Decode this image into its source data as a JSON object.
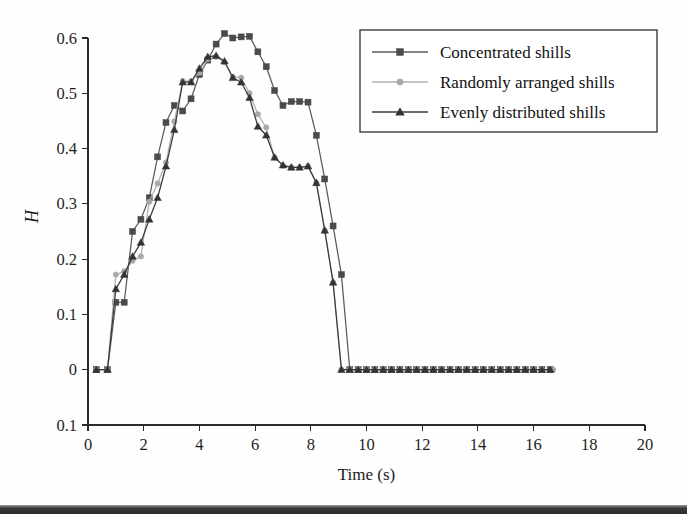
{
  "chart_data": {
    "type": "line",
    "title": "",
    "xlabel": "Time (s)",
    "ylabel": "H",
    "xlim": [
      0,
      20
    ],
    "ylim": [
      -0.1,
      0.6
    ],
    "xticks": [
      0,
      2,
      4,
      6,
      8,
      10,
      12,
      14,
      16,
      18,
      20
    ],
    "xtick_labels": [
      "0",
      "2",
      "4",
      "6",
      "8",
      "10",
      "12",
      "14",
      "16",
      "18",
      "20"
    ],
    "yticks": [
      0.6,
      0.5,
      0.4,
      0.3,
      0.2,
      0.1,
      0,
      -0.1
    ],
    "ytick_labels": [
      "0.6",
      "0.5",
      "0.4",
      "0.3",
      "0.2",
      "0.1",
      "0",
      "0.1"
    ],
    "grid": false,
    "legend_position": "top-right",
    "series": [
      {
        "name": "Concentrated shills",
        "marker": "square",
        "color": "#4a4a4a",
        "line_color": "#5a5a5a",
        "x": [
          0.3,
          0.7,
          1.0,
          1.3,
          1.6,
          1.9,
          2.2,
          2.5,
          2.8,
          3.1,
          3.4,
          3.7,
          4.0,
          4.3,
          4.6,
          4.9,
          5.2,
          5.5,
          5.8,
          6.1,
          6.4,
          6.7,
          7.0,
          7.3,
          7.6,
          7.9,
          8.2,
          8.5,
          8.8,
          9.1,
          9.4,
          9.7,
          10.0,
          10.3,
          10.6,
          10.9,
          11.2,
          11.5,
          11.8,
          12.1,
          12.4,
          12.7,
          13.0,
          13.3,
          13.6,
          13.9,
          14.2,
          14.5,
          14.8,
          15.1,
          15.4,
          15.7,
          16.0,
          16.3,
          16.6
        ],
        "y": [
          0.0,
          0.0,
          0.122,
          0.122,
          0.25,
          0.272,
          0.311,
          0.385,
          0.447,
          0.478,
          0.468,
          0.49,
          0.534,
          0.56,
          0.589,
          0.608,
          0.6,
          0.602,
          0.603,
          0.575,
          0.548,
          0.505,
          0.478,
          0.485,
          0.485,
          0.484,
          0.424,
          0.345,
          0.26,
          0.172,
          0.0,
          0.0,
          0.0,
          0.0,
          0.0,
          0.0,
          0.0,
          0.0,
          0.0,
          0.0,
          0.0,
          0.0,
          0.0,
          0.0,
          0.0,
          0.0,
          0.0,
          0.0,
          0.0,
          0.0,
          0.0,
          0.0,
          0.0,
          0.0,
          0.0
        ]
      },
      {
        "name": "Randomly arranged shills",
        "marker": "circle",
        "color": "#a8a8a8",
        "line_color": "#b0b0b0",
        "x": [
          0.3,
          0.7,
          1.0,
          1.3,
          1.6,
          1.9,
          2.2,
          2.5,
          2.8,
          3.1,
          3.4,
          3.7,
          4.0,
          4.3,
          4.6,
          4.9,
          5.2,
          5.5,
          5.8,
          6.1,
          6.4,
          6.7,
          7.0,
          7.3,
          7.6,
          7.9,
          8.2,
          8.5,
          8.8,
          9.1,
          9.4,
          9.7,
          10.0,
          10.3,
          10.6,
          10.9,
          11.2,
          11.5,
          11.8,
          12.1,
          12.4,
          12.7,
          13.0,
          13.3,
          13.6,
          13.9,
          14.2,
          14.5,
          14.8,
          15.1,
          15.4,
          15.7,
          16.0,
          16.3,
          16.7
        ],
        "y": [
          0.0,
          0.0,
          0.172,
          0.178,
          0.197,
          0.205,
          0.304,
          0.337,
          0.375,
          0.449,
          0.522,
          0.522,
          0.537,
          0.562,
          0.566,
          0.556,
          0.53,
          0.528,
          0.5,
          0.462,
          0.438,
          0.384,
          0.369,
          0.366,
          0.366,
          0.368,
          0.338,
          0.252,
          0.158,
          0.0,
          0.0,
          0.0,
          0.0,
          0.0,
          0.0,
          0.0,
          0.0,
          0.0,
          0.0,
          0.0,
          0.0,
          0.0,
          0.0,
          0.0,
          0.0,
          0.0,
          0.0,
          0.0,
          0.0,
          0.0,
          0.0,
          0.0,
          0.0,
          0.0,
          0.0
        ]
      },
      {
        "name": "Evenly distributed shills",
        "marker": "triangle",
        "color": "#333333",
        "line_color": "#3a3a3a",
        "x": [
          0.3,
          0.7,
          1.0,
          1.3,
          1.6,
          1.9,
          2.2,
          2.5,
          2.8,
          3.1,
          3.4,
          3.7,
          4.0,
          4.3,
          4.6,
          4.9,
          5.2,
          5.5,
          5.8,
          6.1,
          6.4,
          6.7,
          7.0,
          7.3,
          7.6,
          7.9,
          8.2,
          8.5,
          8.8,
          9.1,
          9.4,
          9.7,
          10.0,
          10.3,
          10.6,
          10.9,
          11.2,
          11.5,
          11.8,
          12.1,
          12.4,
          12.7,
          13.0,
          13.3,
          13.6,
          13.9,
          14.2,
          14.5,
          14.8,
          15.1,
          15.4,
          15.7,
          16.0,
          16.3,
          16.6
        ],
        "y": [
          0.0,
          0.0,
          0.146,
          0.172,
          0.205,
          0.23,
          0.272,
          0.311,
          0.368,
          0.434,
          0.52,
          0.52,
          0.545,
          0.566,
          0.568,
          0.558,
          0.528,
          0.52,
          0.492,
          0.44,
          0.424,
          0.384,
          0.37,
          0.366,
          0.366,
          0.368,
          0.338,
          0.252,
          0.158,
          0.0,
          0.0,
          0.0,
          0.0,
          0.0,
          0.0,
          0.0,
          0.0,
          0.0,
          0.0,
          0.0,
          0.0,
          0.0,
          0.0,
          0.0,
          0.0,
          0.0,
          0.0,
          0.0,
          0.0,
          0.0,
          0.0,
          0.0,
          0.0,
          0.0,
          0.0
        ]
      }
    ]
  },
  "legend": {
    "items": [
      {
        "label": "Concentrated shills"
      },
      {
        "label": "Randomly arranged shills"
      },
      {
        "label": "Evenly distributed shills"
      }
    ]
  }
}
